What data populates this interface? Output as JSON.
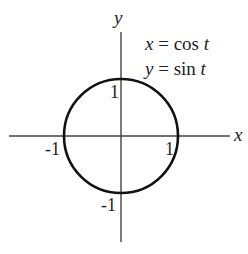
{
  "diagram": {
    "axes": {
      "x_label": "x",
      "y_label": "y"
    },
    "equations": {
      "line1": {
        "var": "x",
        "eq": " = cos ",
        "param": "t"
      },
      "line2": {
        "var": "y",
        "eq": " = sin ",
        "param": "t"
      }
    },
    "ticks": {
      "x_pos": "1",
      "x_neg": "-1",
      "y_pos": "1",
      "y_neg": "-1"
    },
    "curve": {
      "shape": "circle",
      "center": [
        0,
        0
      ],
      "radius": 1,
      "stroke_color": "#111111"
    },
    "axis_color": "#444444"
  }
}
